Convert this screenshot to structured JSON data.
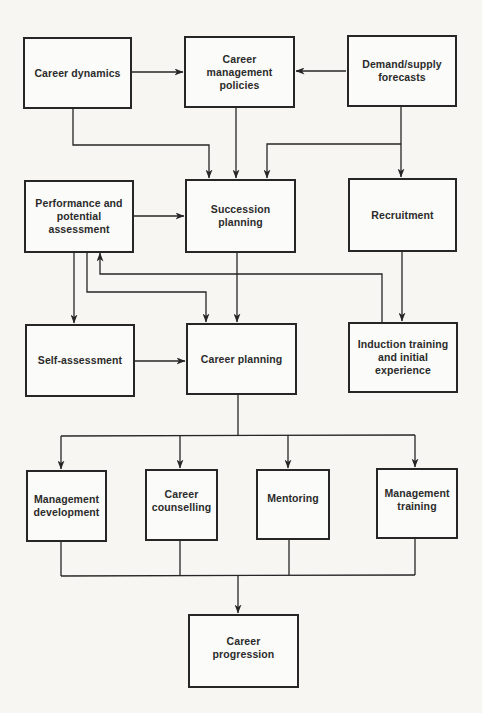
{
  "diagram": {
    "type": "flowchart",
    "colors": {
      "line": "#262626",
      "text": "#2b2b2b",
      "background": "#f7f6f3",
      "box_fill": "#fbfbf9"
    },
    "nodes": {
      "career_dynamics": {
        "label": "Career dynamics"
      },
      "career_management_policies": {
        "label": "Career management\npolicies"
      },
      "demand_supply_forecasts": {
        "label": "Demand/supply\nforecasts"
      },
      "performance_potential_assessment": {
        "label": "Performance and\npotential\nassessment"
      },
      "succession_planning": {
        "label": "Succession planning"
      },
      "recruitment": {
        "label": "Recruitment"
      },
      "self_assessment": {
        "label": "Self-assessment"
      },
      "career_planning": {
        "label": "Career planning"
      },
      "induction_training": {
        "label": "Induction training\nand initial\nexperience"
      },
      "management_development": {
        "label": "Management\ndevelopment"
      },
      "career_counselling": {
        "label": "Career\ncounselling"
      },
      "mentoring": {
        "label": "Mentoring"
      },
      "management_training": {
        "label": "Management\ntraining"
      },
      "career_progression": {
        "label": "Career\nprogression"
      }
    },
    "edges": [
      {
        "from": "career_dynamics",
        "to": "career_management_policies"
      },
      {
        "from": "demand_supply_forecasts",
        "to": "career_management_policies"
      },
      {
        "from": "career_dynamics",
        "to": "succession_planning"
      },
      {
        "from": "career_management_policies",
        "to": "succession_planning"
      },
      {
        "from": "demand_supply_forecasts",
        "to": "succession_planning"
      },
      {
        "from": "demand_supply_forecasts",
        "to": "recruitment"
      },
      {
        "from": "performance_potential_assessment",
        "to": "succession_planning"
      },
      {
        "from": "performance_potential_assessment",
        "to": "self_assessment"
      },
      {
        "from": "performance_potential_assessment",
        "to": "career_planning"
      },
      {
        "from": "succession_planning",
        "to": "career_planning"
      },
      {
        "from": "recruitment",
        "to": "induction_training"
      },
      {
        "from": "induction_training",
        "to": "performance_potential_assessment"
      },
      {
        "from": "self_assessment",
        "to": "career_planning"
      },
      {
        "from": "career_planning",
        "to": "management_development"
      },
      {
        "from": "career_planning",
        "to": "career_counselling"
      },
      {
        "from": "career_planning",
        "to": "mentoring"
      },
      {
        "from": "career_planning",
        "to": "management_training"
      },
      {
        "from": "management_development",
        "to": "career_progression"
      },
      {
        "from": "career_counselling",
        "to": "career_progression"
      },
      {
        "from": "mentoring",
        "to": "career_progression"
      },
      {
        "from": "management_training",
        "to": "career_progression"
      }
    ]
  }
}
